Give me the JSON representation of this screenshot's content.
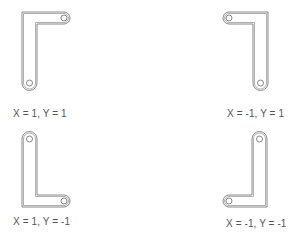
{
  "diagram": {
    "stroke_color": "#7a7a7a",
    "panels": [
      {
        "id": "q1",
        "label": "X = 1, Y = 1"
      },
      {
        "id": "q2",
        "label": "X = -1, Y = 1"
      },
      {
        "id": "q3",
        "label": "X = 1, Y = -1"
      },
      {
        "id": "q4",
        "label": "X = -1, Y = -1"
      }
    ]
  }
}
